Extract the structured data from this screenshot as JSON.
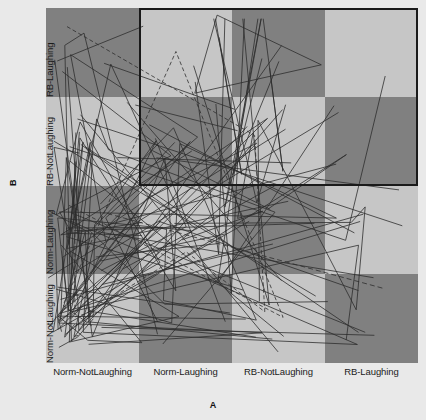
{
  "chart_data": {
    "type": "heatmap",
    "title": "",
    "xlabel": "A",
    "ylabel": "B",
    "grid": false,
    "legend_position": "none",
    "categories_x": [
      "Norm-NotLaughing",
      "Norm-Laughing",
      "RB-NotLaughing",
      "RB-Laughing"
    ],
    "categories_y": [
      "Norm-NotLaughing",
      "Norm-Laughing",
      "RB-NotLaughing",
      "RB-Laughing"
    ],
    "cell_shades": [
      [
        "dark",
        "light",
        "dark",
        "light"
      ],
      [
        "light",
        "dark",
        "light",
        "dark"
      ],
      [
        "dark",
        "light",
        "dark",
        "light"
      ],
      [
        "light",
        "dark",
        "light",
        "dark"
      ]
    ],
    "colors": {
      "dark_cell": "#808080",
      "light_cell": "#c6c6c6",
      "background": "#e9e9e9",
      "line": "#2b2b2b",
      "highlight_border": "#1a1a1a"
    },
    "highlight_region": {
      "x_start_category": "Norm-Laughing",
      "x_end_category": "RB-Laughing",
      "y_start_category": "RB-NotLaughing",
      "y_end_category": "RB-Laughing"
    },
    "overlay": "dense segment network of dark polyline traces spanning all cells",
    "segment_count": 180
  },
  "axes": {
    "x_title": "A",
    "y_title": "B",
    "x_ticks": [
      "Norm-NotLaughing",
      "Norm-Laughing",
      "RB-NotLaughing",
      "RB-Laughing"
    ],
    "y_ticks": [
      "Norm-NotLaughing",
      "Norm-Laughing",
      "RB-NotLaughing",
      "RB-Laughing"
    ]
  }
}
